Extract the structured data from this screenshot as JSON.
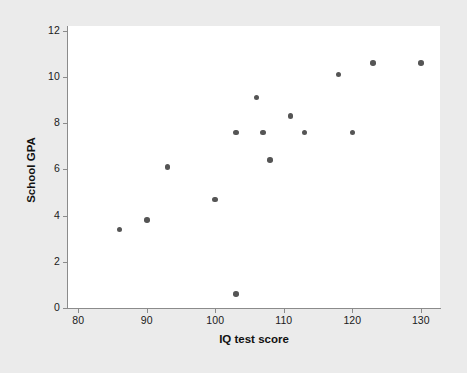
{
  "chart_data": {
    "type": "scatter",
    "title": "",
    "xlabel": "IQ test score",
    "ylabel": "School GPA",
    "xlim": [
      78.5,
      132.8
    ],
    "ylim": [
      0,
      12.2
    ],
    "xticks": [
      80,
      90,
      100,
      110,
      120,
      130
    ],
    "xtick_labels": [
      "80",
      "90",
      "100",
      "110",
      "120",
      "130"
    ],
    "yticks": [
      0,
      2,
      4,
      6,
      8,
      10,
      12
    ],
    "ytick_labels": [
      "0",
      "2",
      "4",
      "6",
      "8",
      "10",
      "12"
    ],
    "grid": false,
    "legend": null,
    "marker_color": "#555555",
    "plot_background": "#ffffff",
    "figure_background": "#ebebeb",
    "points": [
      {
        "x": 86,
        "y": 3.4
      },
      {
        "x": 90,
        "y": 3.8
      },
      {
        "x": 93,
        "y": 6.1
      },
      {
        "x": 100,
        "y": 4.7
      },
      {
        "x": 103,
        "y": 0.6
      },
      {
        "x": 103,
        "y": 7.6
      },
      {
        "x": 106,
        "y": 9.1
      },
      {
        "x": 107,
        "y": 7.6
      },
      {
        "x": 108,
        "y": 6.4
      },
      {
        "x": 111,
        "y": 8.3
      },
      {
        "x": 113,
        "y": 7.6
      },
      {
        "x": 118,
        "y": 10.1
      },
      {
        "x": 120,
        "y": 7.6
      },
      {
        "x": 123,
        "y": 10.6
      },
      {
        "x": 130,
        "y": 10.6
      }
    ]
  }
}
